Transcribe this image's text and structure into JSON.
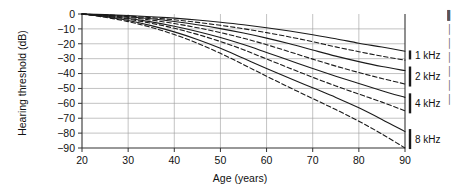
{
  "chart_data": {
    "type": "line",
    "title": "",
    "xlabel": "Age (years)",
    "ylabel": "Hearing threshold (dB)",
    "xlim": [
      15,
      92
    ],
    "ylim": [
      -90,
      0
    ],
    "xticks": [
      20,
      30,
      40,
      50,
      60,
      70,
      80,
      90
    ],
    "yticks": [
      0,
      -10,
      -20,
      -30,
      -40,
      -50,
      -60,
      -70,
      -80,
      -90
    ],
    "xtick_labels": [
      "20",
      "30",
      "40",
      "50",
      "60",
      "70",
      "80",
      "90"
    ],
    "ytick_labels": [
      "0",
      "−10",
      "−20",
      "−30",
      "−40",
      "−50",
      "−60",
      "−70",
      "−80",
      "−90"
    ],
    "grid": true,
    "legend_position": "right-outside",
    "x": [
      20,
      25,
      30,
      35,
      40,
      45,
      50,
      55,
      60,
      65,
      70,
      75,
      80,
      85,
      90
    ],
    "series": [
      {
        "name": "1 kHz solid",
        "frequency": "1 kHz",
        "style": "solid",
        "values": [
          0,
          -0.4,
          -1.0,
          -1.8,
          -2.8,
          -4.0,
          -5.5,
          -7.2,
          -9.2,
          -11.4,
          -13.9,
          -16.6,
          -19.6,
          -22.2,
          -25.0
        ]
      },
      {
        "name": "1 kHz dashed",
        "frequency": "1 kHz",
        "style": "dashed",
        "values": [
          0,
          -0.6,
          -1.4,
          -2.5,
          -3.9,
          -5.6,
          -7.6,
          -9.9,
          -12.5,
          -15.4,
          -18.6,
          -22.1,
          -25.3,
          -28.3,
          -31.0
        ]
      },
      {
        "name": "2 kHz solid",
        "frequency": "2 kHz",
        "style": "solid",
        "values": [
          0,
          -0.8,
          -1.8,
          -3.2,
          -5.0,
          -7.2,
          -9.8,
          -12.8,
          -16.2,
          -20.0,
          -24.2,
          -28.3,
          -32.0,
          -35.3,
          -38.0
        ]
      },
      {
        "name": "2 kHz dashed",
        "frequency": "2 kHz",
        "style": "dashed",
        "values": [
          0,
          -1.0,
          -2.3,
          -4.1,
          -6.4,
          -9.2,
          -12.5,
          -16.3,
          -20.6,
          -25.4,
          -30.3,
          -35.0,
          -39.3,
          -43.3,
          -47.0
        ]
      },
      {
        "name": "4 kHz solid",
        "frequency": "4 kHz",
        "style": "solid",
        "values": [
          0,
          -1.3,
          -3.0,
          -5.3,
          -8.2,
          -11.7,
          -15.8,
          -20.5,
          -25.8,
          -31.2,
          -36.6,
          -41.8,
          -46.7,
          -51.5,
          -56.0
        ]
      },
      {
        "name": "4 kHz dashed",
        "frequency": "4 kHz",
        "style": "dashed",
        "values": [
          0,
          -1.5,
          -3.5,
          -6.2,
          -9.6,
          -13.7,
          -18.5,
          -24.0,
          -30.2,
          -36.4,
          -42.5,
          -48.3,
          -53.8,
          -59.2,
          -65.0
        ]
      },
      {
        "name": "8 kHz solid",
        "frequency": "8 kHz",
        "style": "solid",
        "values": [
          0,
          -1.9,
          -4.4,
          -7.8,
          -12.0,
          -17.1,
          -23.0,
          -29.8,
          -36.6,
          -43.2,
          -49.6,
          -56.0,
          -63.0,
          -70.8,
          -79.0
        ]
      },
      {
        "name": "8 kHz dashed",
        "frequency": "8 kHz",
        "style": "dashed",
        "values": [
          0,
          -2.2,
          -5.1,
          -9.0,
          -13.8,
          -19.6,
          -26.4,
          -34.0,
          -41.8,
          -49.4,
          -56.8,
          -64.2,
          -72.0,
          -80.6,
          -90.0
        ]
      }
    ],
    "legend": [
      {
        "label": "1 kHz",
        "y_value": -27.5
      },
      {
        "label": "2 kHz",
        "y_value": -42.0
      },
      {
        "label": "4 kHz",
        "y_value": -60.0
      },
      {
        "label": "8 kHz",
        "y_value": -84.0
      }
    ]
  },
  "side_text_fragments": [
    "▌",
    "│",
    "│",
    "│",
    "│",
    "│",
    "│"
  ]
}
